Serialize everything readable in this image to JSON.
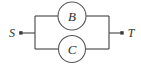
{
  "figure": {
    "background_color": "#ffffff",
    "line_color": "#4a4a48",
    "label_color": "#2e2e2c",
    "width": 141,
    "height": 66
  },
  "terminals": [
    {
      "id": "source",
      "label": "S",
      "side": "left",
      "dot_x": 21,
      "dot_y": 33
    },
    {
      "id": "target",
      "label": "T",
      "side": "right",
      "dot_x": 122,
      "dot_y": 33
    }
  ],
  "nodes": [
    {
      "id": "node-b",
      "label": "B",
      "branch": "top",
      "cx": 72,
      "cy": 16,
      "r": 14
    },
    {
      "id": "node-c",
      "label": "C",
      "branch": "bottom",
      "cx": 72,
      "cy": 49,
      "r": 13.5
    }
  ],
  "wires": {
    "left_bus_x": 35,
    "right_bus_x": 109,
    "top_branch_y": 16,
    "bottom_branch_y": 49,
    "mid_y": 33
  }
}
